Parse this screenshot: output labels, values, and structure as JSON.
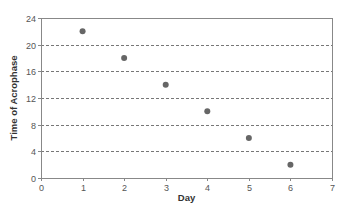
{
  "chart_data": {
    "type": "scatter",
    "title": "",
    "xlabel": "Day",
    "ylabel": "Time of Acrophase",
    "x": [
      1,
      2,
      3,
      4,
      5,
      6
    ],
    "y": [
      22,
      18,
      14,
      10,
      6,
      2
    ],
    "series": [
      {
        "name": "Time of Acrophase",
        "x": [
          1,
          2,
          3,
          4,
          5,
          6
        ],
        "y": [
          22,
          18,
          14,
          10,
          6,
          2
        ],
        "color": "#666666"
      }
    ],
    "xlim": [
      0,
      7
    ],
    "ylim": [
      0,
      24
    ],
    "xticks": [
      0,
      1,
      2,
      3,
      4,
      5,
      6,
      7
    ],
    "yticks": [
      0,
      4,
      8,
      12,
      16,
      20,
      24
    ],
    "grid": {
      "horizontal": true,
      "vertical": false,
      "style": "dashed"
    },
    "legend": null
  },
  "colors": {
    "marker": "#666666",
    "frame": "#888888",
    "grid": "#777777",
    "text": "#555555"
  }
}
